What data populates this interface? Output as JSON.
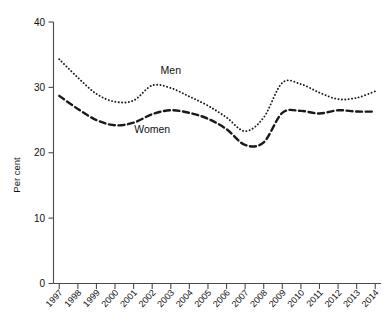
{
  "chart_data": {
    "type": "line",
    "title": "",
    "xlabel": "",
    "ylabel": "Per cent",
    "ylim": [
      0,
      40
    ],
    "yticks": [
      0,
      10,
      20,
      30,
      40
    ],
    "grid": false,
    "legend_position": "inline-annotation",
    "categories": [
      "1997",
      "1998",
      "1999",
      "2000",
      "2001",
      "2002",
      "2003",
      "2004",
      "2005",
      "2006",
      "2007",
      "2008",
      "2009",
      "2010",
      "2011",
      "2012",
      "2013",
      "2014"
    ],
    "series": [
      {
        "name": "Men",
        "style": "dotted",
        "values": [
          34.3,
          31.5,
          29.0,
          27.8,
          28.0,
          30.3,
          29.9,
          28.6,
          27.2,
          25.4,
          23.3,
          25.4,
          30.7,
          30.5,
          29.2,
          28.2,
          28.4,
          29.4
        ]
      },
      {
        "name": "Women",
        "style": "dashed",
        "values": [
          28.7,
          26.7,
          25.0,
          24.2,
          24.6,
          25.9,
          26.5,
          26.1,
          25.2,
          23.6,
          21.2,
          21.6,
          26.1,
          26.4,
          26.0,
          26.5,
          26.3,
          26.3
        ]
      }
    ],
    "annotations": [
      {
        "text": "Men",
        "near_category": "2003",
        "near_value": 32.0
      },
      {
        "text": "Women",
        "near_category": "2002",
        "near_value": 23.0
      }
    ],
    "colors": {
      "series_line": "#1a1a1a",
      "axis": "#4a4a4a",
      "background": "#ffffff",
      "text": "#111111"
    }
  }
}
